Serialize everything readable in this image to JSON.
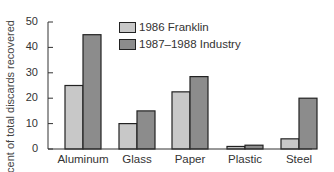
{
  "chart_data": {
    "type": "bar",
    "title": "",
    "xlabel": "",
    "ylabel": "Percent of total discards recovered",
    "ylim": [
      0,
      50
    ],
    "yticks": [
      0,
      10,
      20,
      30,
      40,
      50
    ],
    "categories": [
      "Aluminum",
      "Glass",
      "Paper",
      "Plastic",
      "Steel"
    ],
    "series": [
      {
        "name": "1986 Franklin",
        "color": "#c8c8c8",
        "values": [
          25,
          10,
          22.5,
          1,
          4
        ]
      },
      {
        "name": "1987–1988 Industry",
        "color": "#8c8c8c",
        "values": [
          45,
          15,
          28.5,
          1.5,
          20
        ]
      }
    ],
    "grid": false,
    "legend_position": "upper center"
  },
  "labels": {
    "ylabel": "Percent of total discards recovered",
    "legend": [
      "1986 Franklin",
      "1987–1988 Industry"
    ],
    "yticks": [
      "0",
      "10",
      "20",
      "30",
      "40",
      "50"
    ],
    "categories": [
      "Aluminum",
      "Glass",
      "Paper",
      "Plastic",
      "Steel"
    ]
  }
}
